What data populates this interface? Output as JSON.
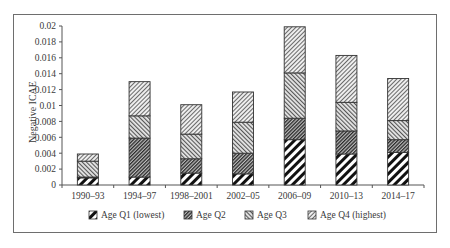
{
  "chart_data": {
    "type": "bar",
    "stacked": true,
    "title": "",
    "xlabel": "",
    "ylabel": "Negative ICAE",
    "ylim": [
      0,
      0.02
    ],
    "yticks": [
      "0",
      "0.002",
      "0.004",
      "0.006",
      "0.008",
      "0.01",
      "0.012",
      "0.014",
      "0.016",
      "0.018",
      "0.02"
    ],
    "ytick_values": [
      0,
      0.002,
      0.004,
      0.006,
      0.008,
      0.01,
      0.012,
      0.014,
      0.016,
      0.018,
      0.02
    ],
    "grid": false,
    "legend_position": "bottom",
    "categories": [
      "1990–93",
      "1994–97",
      "1998–2001",
      "2002–05",
      "2006–09",
      "2010–13",
      "2014–17"
    ],
    "series": [
      {
        "name": "Age Q1 (lowest)",
        "pattern": "wide-diagonal-black",
        "values": [
          0.0009,
          0.001,
          0.0015,
          0.0014,
          0.0057,
          0.0039,
          0.0041
        ]
      },
      {
        "name": "Age Q2",
        "pattern": "dense-diagonal-dark",
        "values": [
          0.0001,
          0.0049,
          0.0018,
          0.0026,
          0.0027,
          0.0029,
          0.0016
        ]
      },
      {
        "name": "Age Q3",
        "pattern": "medium-diagonal-forward",
        "values": [
          0.002,
          0.0028,
          0.0031,
          0.0039,
          0.0057,
          0.0036,
          0.0024
        ]
      },
      {
        "name": "Age Q4 (highest)",
        "pattern": "fine-diagonal-light",
        "values": [
          0.0009,
          0.0043,
          0.0037,
          0.0038,
          0.0058,
          0.0059,
          0.0053
        ]
      }
    ]
  },
  "colors": {
    "axis": "#555555",
    "text": "#3a3a3a",
    "bar_outline": "#333333"
  }
}
